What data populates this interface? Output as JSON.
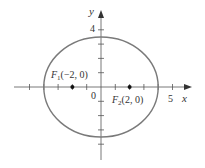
{
  "diagram": {
    "type": "ellipse-with-foci",
    "equation_implied": "x^2/16 + y^2/12 = 1",
    "x_axis": {
      "label": "x",
      "tick_label": "5",
      "ticks": [
        -5,
        -4,
        -3,
        -2,
        -1,
        1,
        2,
        3,
        4,
        5
      ]
    },
    "y_axis": {
      "label": "y",
      "tick_label": "4",
      "ticks": [
        -5,
        -4,
        -3,
        -2,
        -1,
        1,
        2,
        3,
        4
      ]
    },
    "origin_label": "0",
    "foci": [
      {
        "name": "F",
        "sub": "1",
        "coords": "(−2, 0)",
        "x": -2,
        "y": 0
      },
      {
        "name": "F",
        "sub": "2",
        "coords": "(2, 0)",
        "x": 2,
        "y": 0
      }
    ],
    "ellipse": {
      "a": 4,
      "b": 3.46
    },
    "colors": {
      "ellipse": "#7a7a7a",
      "axis": "#444444",
      "point": "#111111"
    }
  }
}
